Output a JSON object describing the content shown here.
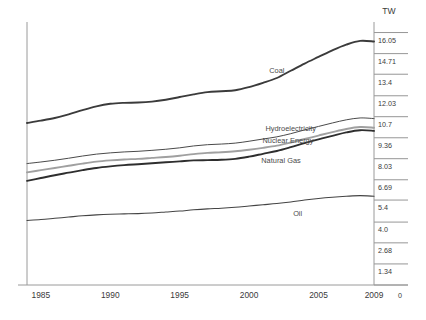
{
  "chart_data": {
    "type": "line",
    "title": "",
    "subtitle": "",
    "xlabel": "",
    "ylabel": "TW",
    "unit": "TW",
    "grid": false,
    "legend_position": "inline-annotations",
    "xlim": [
      1984,
      2009
    ],
    "ylim": [
      0,
      16.72
    ],
    "x_ticks": [
      "1985",
      "1990",
      "1995",
      "2000",
      "2005",
      "2009"
    ],
    "x_tick_values": [
      1985,
      1990,
      1995,
      2000,
      2005,
      2009
    ],
    "y_ticks": [
      "16.05",
      "14.71",
      "13.4",
      "12.03",
      "10.7",
      "9.36",
      "8.03",
      "6.69",
      "5.4",
      "4.0",
      "2.68",
      "1.34",
      "0"
    ],
    "y_tick_values": [
      16.05,
      14.71,
      13.4,
      12.03,
      10.7,
      9.36,
      8.03,
      6.69,
      5.4,
      4.0,
      2.68,
      1.34,
      0
    ],
    "x": [
      1984,
      1985,
      1986,
      1987,
      1988,
      1989,
      1990,
      1991,
      1992,
      1993,
      1994,
      1995,
      1996,
      1997,
      1998,
      1999,
      2000,
      2001,
      2002,
      2003,
      2004,
      2005,
      2006,
      2007,
      2008,
      2009
    ],
    "series": [
      {
        "name": "Coal",
        "label": "Coal",
        "color": "#3b3b3b",
        "stroke_width": 1.9,
        "values": [
          10.3,
          10.45,
          10.62,
          10.85,
          11.12,
          11.36,
          11.52,
          11.58,
          11.6,
          11.66,
          11.78,
          11.95,
          12.12,
          12.26,
          12.32,
          12.38,
          12.58,
          12.85,
          13.16,
          13.62,
          14.08,
          14.5,
          14.92,
          15.28,
          15.52,
          15.48
        ]
      },
      {
        "name": "Hydroelectricity",
        "label": "Hydroelectricity",
        "color": "#4a4a4a",
        "stroke_width": 1.0,
        "values": [
          7.72,
          7.82,
          7.93,
          8.06,
          8.2,
          8.32,
          8.4,
          8.46,
          8.5,
          8.56,
          8.63,
          8.72,
          8.84,
          8.92,
          8.96,
          9.02,
          9.14,
          9.28,
          9.42,
          9.62,
          9.86,
          10.08,
          10.3,
          10.5,
          10.62,
          10.58
        ]
      },
      {
        "name": "Nuclear Energy",
        "label": "Nuclear Energy",
        "color": "#a0a0a0",
        "stroke_width": 1.9,
        "values": [
          7.16,
          7.3,
          7.44,
          7.58,
          7.72,
          7.84,
          7.92,
          7.98,
          8.02,
          8.08,
          8.14,
          8.22,
          8.32,
          8.4,
          8.44,
          8.5,
          8.6,
          8.72,
          8.86,
          9.06,
          9.28,
          9.5,
          9.72,
          9.92,
          10.04,
          10.0
        ]
      },
      {
        "name": "Natural Gas",
        "label": "Natural Gas",
        "color": "#2e2e2e",
        "stroke_width": 1.9,
        "values": [
          6.62,
          6.8,
          6.98,
          7.14,
          7.3,
          7.44,
          7.54,
          7.62,
          7.68,
          7.74,
          7.8,
          7.86,
          7.92,
          7.94,
          7.96,
          8.02,
          8.16,
          8.34,
          8.52,
          8.76,
          9.02,
          9.26,
          9.48,
          9.7,
          9.84,
          9.8
        ]
      },
      {
        "name": "Oil",
        "label": "Oil",
        "color": "#444444",
        "stroke_width": 1.1,
        "values": [
          4.1,
          4.16,
          4.24,
          4.32,
          4.4,
          4.46,
          4.5,
          4.52,
          4.54,
          4.58,
          4.64,
          4.7,
          4.78,
          4.84,
          4.88,
          4.94,
          5.02,
          5.1,
          5.18,
          5.28,
          5.4,
          5.5,
          5.58,
          5.64,
          5.68,
          5.64
        ]
      }
    ],
    "annotations": [
      {
        "text": "Coal",
        "x": 2002,
        "y": 13.45
      },
      {
        "text": "Hydroelectricity",
        "x": 2003,
        "y": 9.8
      },
      {
        "text": "Nuclear Energy",
        "x": 2002.8,
        "y": 9.05
      },
      {
        "text": "Natural Gas",
        "x": 2002.3,
        "y": 7.75
      },
      {
        "text": "Oil",
        "x": 2003.5,
        "y": 4.4
      }
    ]
  }
}
